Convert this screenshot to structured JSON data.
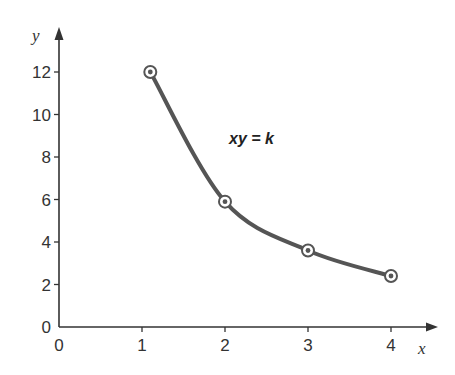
{
  "chart_data": {
    "type": "line",
    "title": "",
    "xlabel": "x",
    "ylabel": "y",
    "xlim": [
      0,
      4.5
    ],
    "ylim": [
      0,
      13.5
    ],
    "x_ticks": [
      0,
      1,
      2,
      3,
      4
    ],
    "y_ticks": [
      0,
      2,
      4,
      6,
      8,
      10,
      12
    ],
    "grid": false,
    "legend": null,
    "series": [
      {
        "name": "xy = k",
        "points": [
          {
            "x": 1.1,
            "y": 12.0
          },
          {
            "x": 2.0,
            "y": 5.9
          },
          {
            "x": 3.0,
            "y": 3.6
          },
          {
            "x": 4.0,
            "y": 2.4
          }
        ]
      }
    ],
    "annotations": [
      {
        "text": "xy = k",
        "x": 2.05,
        "y": 8.6
      }
    ]
  },
  "colors": {
    "axis": "#333333",
    "curve": "#555555",
    "marker_ring": "#555555",
    "marker_fill": "#ffffff"
  }
}
